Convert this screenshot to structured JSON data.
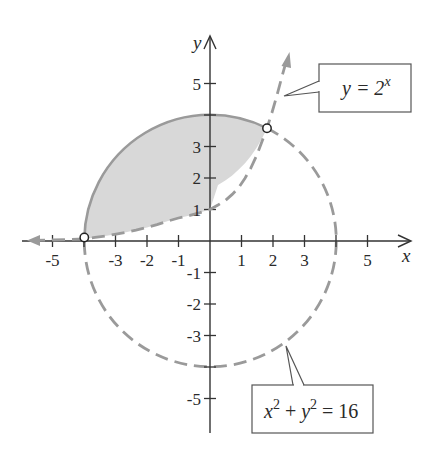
{
  "figure": {
    "x_axis_label": "x",
    "y_axis_label": "y",
    "x_tick_labels": [
      "-5",
      "-3",
      "-2",
      "-1",
      "1",
      "2",
      "3",
      "5"
    ],
    "y_tick_labels": [
      "5",
      "3",
      "2",
      "1",
      "-1",
      "-2",
      "-3",
      "-5"
    ],
    "callouts": {
      "exponential": {
        "base": "y = 2",
        "exponent": "x"
      },
      "circle": {
        "x": "x",
        "x_exp": "2",
        "plus": " + ",
        "y": "y",
        "y_exp": "2",
        "rhs": " = 16"
      }
    },
    "colors": {
      "axis": "#333333",
      "curve": "#9a9a9a",
      "fill": "#d8d8d8",
      "callout_border": "#555555"
    },
    "intersection_points": [
      {
        "x": -3.99,
        "y": 0.06
      },
      {
        "x": 1.84,
        "y": 3.58
      }
    ]
  }
}
